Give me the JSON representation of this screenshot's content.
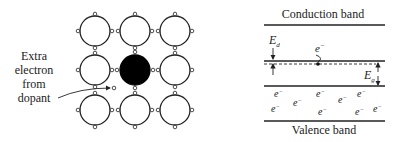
{
  "left_panel": {
    "annotation_lines": [
      "Extra",
      "electron",
      "from",
      "dopant"
    ],
    "lattice": {
      "rows": 3,
      "cols": 3,
      "dopant_position": {
        "row": 1,
        "col": 1
      },
      "atom_color": "#ffffff",
      "dopant_color": "#000000"
    }
  },
  "right_panel": {
    "conduction_band_label": "Conduction band",
    "valence_band_label": "Valence band",
    "donor_energy_label": "E",
    "donor_energy_subscript": "d",
    "gap_energy_label": "E",
    "gap_energy_subscript": "g",
    "electron_symbol": "e",
    "electron_superscript": "−",
    "valence_electron_count": 10
  }
}
